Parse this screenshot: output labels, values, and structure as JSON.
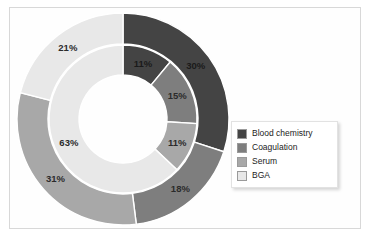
{
  "chart_data": {
    "type": "pie",
    "variant": "nested-donut",
    "title": "",
    "subtitle": "",
    "xlabel": "",
    "ylabel": "",
    "grid": false,
    "legend_position": "right",
    "start_angle_deg": 0,
    "direction": "clockwise",
    "categories": [
      "Blood chemistry",
      "Coagulation",
      "Serum",
      "BGA"
    ],
    "colors": {
      "blood_chemistry": "#444444",
      "coagulation": "#7e7e7e",
      "serum": "#a8a8a8",
      "bga": "#e8e8e8",
      "separator": "#ffffff",
      "label_text": "#2b2b2b",
      "frame": "#d8d8d8",
      "background": "#ffffff"
    },
    "series": [
      {
        "name": "Outer ring",
        "ring": "outer",
        "values": [
          30,
          18,
          31,
          21
        ],
        "labels": [
          "30%",
          "18%",
          "31%",
          "21%"
        ]
      },
      {
        "name": "Inner ring",
        "ring": "inner",
        "values": [
          11,
          15,
          11,
          63
        ],
        "labels": [
          "11%",
          "15%",
          "11%",
          "63%"
        ]
      }
    ],
    "annotations": []
  },
  "legend": {
    "items": [
      {
        "label": "Blood chemistry",
        "color": "#444444"
      },
      {
        "label": "Coagulation",
        "color": "#7e7e7e"
      },
      {
        "label": "Serum",
        "color": "#a8a8a8"
      },
      {
        "label": "BGA",
        "color": "#e8e8e8"
      }
    ]
  }
}
